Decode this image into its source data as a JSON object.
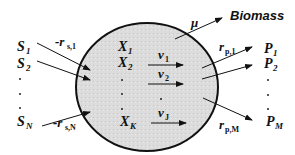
{
  "diagram": {
    "type": "cell-metabolism-schematic",
    "cell": {
      "fill": "#dcdcdc",
      "stroke": "#111111"
    },
    "biomass": {
      "label": "Biomass",
      "rate_symbol": "μ"
    },
    "substrates": [
      {
        "label": "S",
        "sub": "1",
        "rate": "-r",
        "rate_sub": "s,1"
      },
      {
        "label": "S",
        "sub": "2"
      },
      {
        "label": "S",
        "sub": "N",
        "rate": "-r",
        "rate_sub": "s,N"
      }
    ],
    "intracellular": [
      {
        "label": "X",
        "sub": "1"
      },
      {
        "label": "X",
        "sub": "2"
      },
      {
        "label": "X",
        "sub": "K"
      }
    ],
    "fluxes": [
      {
        "label": "v",
        "sub": "1"
      },
      {
        "label": "v",
        "sub": "2"
      },
      {
        "label": "v",
        "sub": "J"
      }
    ],
    "products": [
      {
        "label": "P",
        "sub": "1",
        "rate": "r",
        "rate_sub": "p,1"
      },
      {
        "label": "P",
        "sub": "2"
      },
      {
        "label": "P",
        "sub": "M",
        "rate": "r",
        "rate_sub": "p,M"
      }
    ]
  }
}
